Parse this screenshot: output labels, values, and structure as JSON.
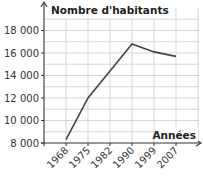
{
  "chart_data": {
    "type": "line",
    "title": "",
    "xlabel": "Années",
    "ylabel": "Nombre d'habitants",
    "categories": [
      "1968",
      "1975",
      "1982",
      "1990",
      "1999",
      "2007"
    ],
    "series": [
      {
        "name": "Nombre d'habitants",
        "values": [
          8300,
          12000,
          14400,
          16800,
          16100,
          15700
        ]
      }
    ],
    "y_ticks": [
      8000,
      10000,
      12000,
      14000,
      16000,
      18000
    ],
    "y_tick_labels": [
      "8 000",
      "10 000",
      "12 000",
      "14 000",
      "16 000",
      "18 000"
    ],
    "ylim": [
      8000,
      19000
    ],
    "grid": true,
    "legend": "none",
    "colors": {
      "line": "#444444",
      "grid": "#cccccc",
      "axis": "#333333"
    }
  },
  "labels": {
    "ylabel": "Nombre d'habitants",
    "xlabel": "Années"
  }
}
